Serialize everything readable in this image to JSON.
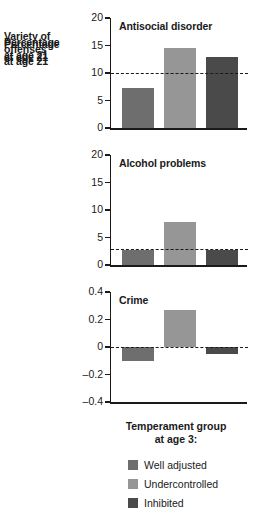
{
  "chart_data": [
    {
      "type": "bar",
      "title": "Antisocial disorder",
      "categories": [
        "Well adjusted",
        "Undercontrolled",
        "Inhibited"
      ],
      "values": [
        7.2,
        14.5,
        13.0
      ],
      "ylabel": "Percentage at age 21",
      "xlabel": "",
      "ylim": [
        0,
        20
      ],
      "yticks": [
        "0",
        "5",
        "10",
        "15",
        "20"
      ],
      "ytick_values": [
        0,
        5,
        10,
        15,
        20
      ],
      "reference_line": 10,
      "grid": false
    },
    {
      "type": "bar",
      "title": "Alcohol problems",
      "categories": [
        "Well adjusted",
        "Undercontrolled",
        "Inhibited"
      ],
      "values": [
        2.8,
        7.8,
        2.7
      ],
      "ylabel": "Percentage at age 21",
      "xlabel": "",
      "ylim": [
        0,
        20
      ],
      "yticks": [
        "0",
        "5",
        "10",
        "15",
        "20"
      ],
      "ytick_values": [
        0,
        5,
        10,
        15,
        20
      ],
      "reference_line": 3.0,
      "grid": false
    },
    {
      "type": "bar",
      "title": "Crime",
      "categories": [
        "Well adjusted",
        "Undercontrolled",
        "Inhibited"
      ],
      "values": [
        -0.1,
        0.27,
        -0.05
      ],
      "ylabel": "Variety of offenses at age 21",
      "xlabel": "Temperament group at age 3:",
      "ylim": [
        -0.4,
        0.4
      ],
      "yticks": [
        "-0.4",
        "-0.2",
        "0",
        "0.2",
        "0.4"
      ],
      "ytick_values": [
        -0.4,
        -0.2,
        0,
        0.2,
        0.4
      ],
      "reference_line": 0,
      "grid": false
    }
  ],
  "panels": [
    {
      "title": "Antisocial disorder",
      "axis_label_line1": "Percentage",
      "axis_label_line2": "at age 21",
      "ticks": [
        "20",
        "15",
        "10",
        "5",
        "0"
      ]
    },
    {
      "title": "Alcohol problems",
      "axis_label_line1": "Percentage",
      "axis_label_line2": "at age 21",
      "ticks": [
        "20",
        "15",
        "10",
        "5",
        "0"
      ]
    },
    {
      "title": "Crime",
      "axis_label_line1": "Variety of",
      "axis_label_line2": "offenses",
      "axis_label_line3": "at age 21",
      "ticks": [
        "0.4",
        "0.2",
        "0",
        "–0.2",
        "–0.4"
      ]
    }
  ],
  "xcaption": {
    "line1": "Temperament group",
    "line2": "at age 3:"
  },
  "legend": {
    "items": [
      {
        "label": "Well adjusted",
        "color": "#6e6e6e"
      },
      {
        "label": "Undercontrolled",
        "color": "#969696"
      },
      {
        "label": "Inhibited",
        "color": "#4a4a4a"
      }
    ]
  },
  "colors": {
    "well_adjusted": "#6e6e6e",
    "undercontrolled": "#969696",
    "inhibited": "#4a4a4a",
    "axis": "#1a1a1a",
    "background": "#ffffff"
  }
}
